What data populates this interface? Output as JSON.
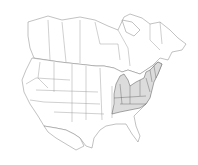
{
  "map": {
    "region": "North America (Canada, United States, northern Mexico)",
    "style": "outline range map",
    "colors": {
      "background": "#ffffff",
      "boundary": "#777777",
      "range_fill": "#dcdcdc"
    },
    "shaded_range": [
      "Michigan (Lower Peninsula)",
      "Ohio",
      "Indiana",
      "Kentucky",
      "Tennessee (north/east)",
      "West Virginia",
      "Virginia",
      "North Carolina (west)",
      "Maryland",
      "Delaware",
      "Pennsylvania",
      "New Jersey",
      "New York",
      "Connecticut",
      "Rhode Island",
      "Massachusetts",
      "Vermont",
      "New Hampshire",
      "Maine"
    ]
  }
}
